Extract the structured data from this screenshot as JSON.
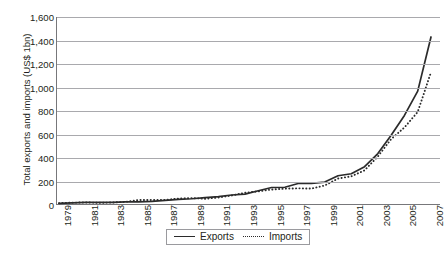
{
  "chart_data": {
    "type": "line",
    "title": "",
    "xlabel": "",
    "ylabel": "Total exports and imports (US$ 1bn)",
    "ylim": [
      0,
      1600
    ],
    "ytick_step": 200,
    "ytick_labels": [
      "1,600",
      "1,400",
      "1,200",
      "1,000",
      "800",
      "600",
      "400",
      "200",
      "0"
    ],
    "ytick_values": [
      1600,
      1400,
      1200,
      1000,
      800,
      600,
      400,
      200,
      0
    ],
    "grid": true,
    "legend_position": "bottom-center",
    "x": [
      1979,
      1980,
      1981,
      1982,
      1983,
      1984,
      1985,
      1986,
      1987,
      1988,
      1989,
      1990,
      1991,
      1992,
      1993,
      1994,
      1995,
      1996,
      1997,
      1998,
      1999,
      2000,
      2001,
      2002,
      2003,
      2004,
      2005,
      2006,
      2007
    ],
    "xtick_labels": [
      "1979",
      "1981",
      "1983",
      "1985",
      "1987",
      "1989",
      "1991",
      "1993",
      "1995",
      "1997",
      "1999",
      "2001",
      "2003",
      "2005",
      "2007"
    ],
    "xtick_values": [
      1979,
      1981,
      1983,
      1985,
      1987,
      1989,
      1991,
      1993,
      1995,
      1997,
      1999,
      2001,
      2003,
      2005,
      2007
    ],
    "series": [
      {
        "name": "Exports",
        "style": "solid",
        "color": "#2b2b2b",
        "values": [
          14,
          18,
          22,
          22,
          22,
          26,
          27,
          31,
          39,
          48,
          53,
          62,
          72,
          85,
          92,
          121,
          149,
          151,
          183,
          184,
          195,
          249,
          266,
          326,
          438,
          593,
          762,
          969,
          1430
        ]
      },
      {
        "name": "Imports",
        "style": "dotted",
        "color": "#2b2b2b",
        "values": [
          16,
          20,
          22,
          19,
          21,
          27,
          42,
          43,
          43,
          55,
          59,
          53,
          64,
          81,
          104,
          116,
          132,
          139,
          142,
          140,
          166,
          225,
          244,
          295,
          413,
          561,
          660,
          792,
          1130
        ]
      }
    ]
  },
  "legend": {
    "items": [
      {
        "label": "Exports",
        "style": "solid"
      },
      {
        "label": "Imports",
        "style": "dotted"
      }
    ]
  },
  "caption": ""
}
